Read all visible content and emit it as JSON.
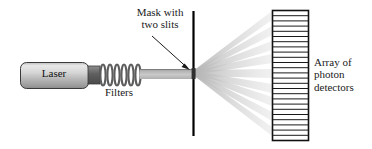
{
  "figure": {
    "background_color": "#ffffff"
  },
  "labels": {
    "mask": "Mask with\ntwo slits",
    "laser": "Laser",
    "filters": "Filters",
    "detector_array": "Array of\nphoton\ndetectors"
  },
  "colors": {
    "ink": "#1a1a1a",
    "mask_line": "#000000",
    "beam_light": "#c8c8c8",
    "beam_dark": "#8c8c8c",
    "ray": "#cfcfcf",
    "laser_body_light": "#e2e2e2",
    "laser_body_mid": "#bcbcbc",
    "laser_body_dark": "#8f8f8f",
    "laser_outline": "#3a3a3a",
    "coil": "#6b6b6b",
    "detector_frame": "#111111",
    "detector_cell": "#ffffff"
  },
  "components": {
    "laser": {
      "name": "Laser",
      "x": 20,
      "y": 62,
      "width": 68,
      "height": 26,
      "corner_radius": 6
    },
    "nozzle": {
      "name": "laser-nozzle",
      "x": 88,
      "y": 66,
      "width": 12,
      "height": 18
    },
    "filters": {
      "name": "Filters",
      "x": 100,
      "y": 64,
      "width": 42,
      "height": 22,
      "loops": 6
    },
    "beam": {
      "name": "laser-beam",
      "x1": 142,
      "x2": 193,
      "y_top": 69,
      "y_bottom": 79
    },
    "mask": {
      "name": "mask-with-two-slits",
      "x": 193,
      "y_top": 11,
      "y_bottom": 136,
      "thickness": 2,
      "slit_y": 73
    },
    "arrow": {
      "name": "mask-pointer-arrow",
      "x1": 152,
      "y1": 36,
      "x2": 189,
      "y2": 69
    },
    "detector_array": {
      "name": "photon-detector-array",
      "x": 272,
      "y": 10,
      "width": 36,
      "height": 130,
      "cells": 25
    },
    "ray_fan": {
      "name": "diffracted-light-fan",
      "origin_x": 193,
      "origin_y": 73,
      "target_x": 272,
      "ray_count": 9,
      "target_y_values": [
        15,
        30,
        45,
        58,
        73,
        88,
        101,
        116,
        131
      ]
    }
  }
}
